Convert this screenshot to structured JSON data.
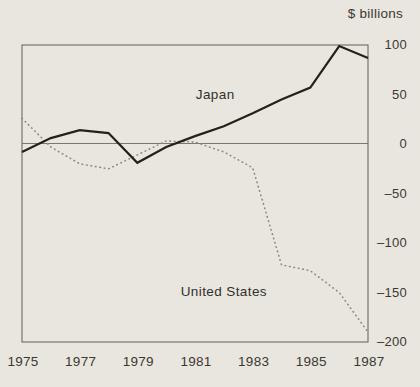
{
  "figure": {
    "unit_label": "$ billions"
  },
  "chart_data": {
    "type": "line",
    "title": "$ billions",
    "xlabel": "",
    "ylabel": "$ billions",
    "xlim": [
      1975,
      1987
    ],
    "ylim": [
      -200,
      100
    ],
    "grid": false,
    "zero_line": true,
    "legend_position": "inline-annotations",
    "x": [
      1975,
      1976,
      1977,
      1978,
      1979,
      1980,
      1981,
      1982,
      1983,
      1984,
      1985,
      1986,
      1987
    ],
    "series": [
      {
        "name": "Japan",
        "style": "solid",
        "color": "#25211a",
        "values": [
          -8,
          6,
          14,
          11,
          -19,
          -3,
          8,
          18,
          31,
          45,
          57,
          99,
          87
        ]
      },
      {
        "name": "United States",
        "style": "dotted",
        "color": "#8f8b81",
        "values": [
          26,
          -3,
          -20,
          -25,
          -11,
          3,
          2,
          -8,
          -24,
          -122,
          -128,
          -150,
          -190
        ]
      }
    ],
    "y_ticks": [
      {
        "label": "100",
        "value": 100
      },
      {
        "label": "50",
        "value": 50
      },
      {
        "label": "0",
        "value": 0
      },
      {
        "label": "–50",
        "value": -50
      },
      {
        "label": "–100",
        "value": -100
      },
      {
        "label": "–150",
        "value": -150
      },
      {
        "label": "–200",
        "value": -200
      }
    ],
    "x_ticks": [
      {
        "label": "1975",
        "value": 1975
      },
      {
        "label": "1977",
        "value": 1977
      },
      {
        "label": "1979",
        "value": 1979
      },
      {
        "label": "1981",
        "value": 1981
      },
      {
        "label": "1983",
        "value": 1983
      },
      {
        "label": "1985",
        "value": 1985
      },
      {
        "label": "1987",
        "value": 1987
      }
    ],
    "annotations": [
      {
        "text": "Japan",
        "x": 1981.7,
        "y": 51
      },
      {
        "text": "United States",
        "x": 1982.0,
        "y": -148
      }
    ]
  }
}
